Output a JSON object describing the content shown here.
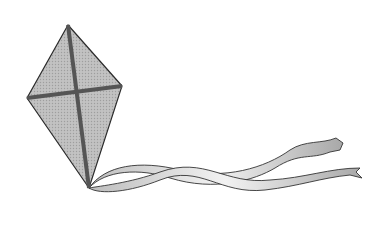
{
  "scene": {
    "subject": "kite with two ribbon tails",
    "background": "#ffffff",
    "kite_fill": "#b8b8b8",
    "spar_color": "#555555",
    "ribbon_fill": "#e4e4e4",
    "outline": "#333333"
  }
}
